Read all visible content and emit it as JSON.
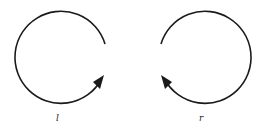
{
  "diagrams": [
    {
      "id": "left",
      "label": "l",
      "direction": "counterclockwise",
      "stroke": "#1a1a1a"
    },
    {
      "id": "right",
      "label": "r",
      "direction": "clockwise",
      "stroke": "#1a1a1a"
    }
  ]
}
